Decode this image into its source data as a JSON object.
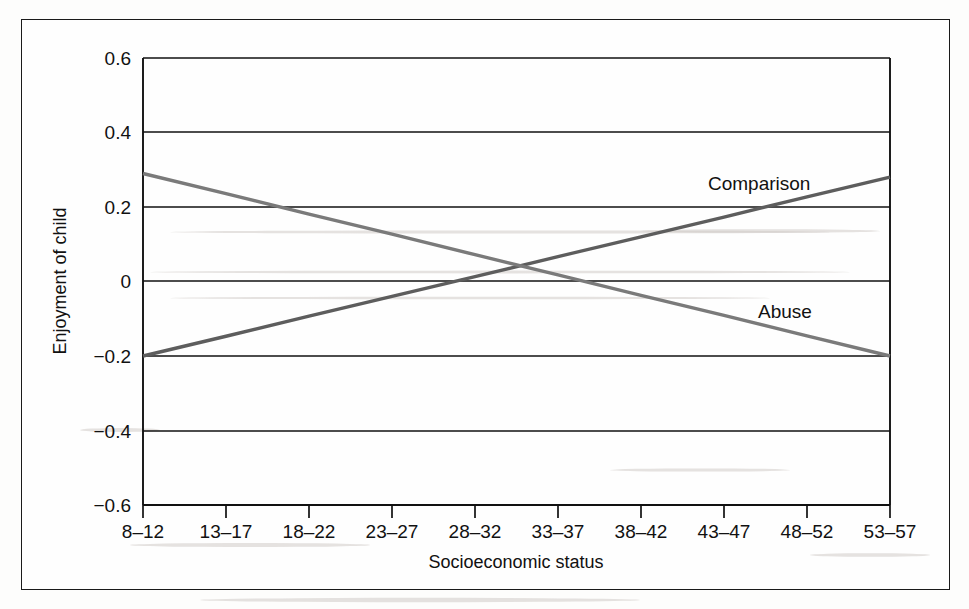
{
  "chart_data": {
    "type": "line",
    "title": "",
    "xlabel": "Socioeconomic status",
    "ylabel": "Enjoyment of child",
    "categories": [
      "8–12",
      "13–17",
      "18–22",
      "23–27",
      "28–32",
      "33–37",
      "38–42",
      "43–47",
      "48–52",
      "53–57"
    ],
    "ylim": [
      -0.6,
      0.6
    ],
    "yticks": [
      0.6,
      0.4,
      0.2,
      0,
      -0.2,
      -0.4,
      -0.6
    ],
    "ytick_labels": [
      "0.6",
      "0.4",
      "0.2",
      "0",
      "−0.2",
      "−0.4",
      "−0.6"
    ],
    "grid": true,
    "legend_position": "inline-annotations",
    "series": [
      {
        "name": "Comparison",
        "color": "#5d5d5d",
        "values": [
          -0.2,
          -0.147,
          -0.093,
          -0.04,
          0.013,
          0.067,
          0.12,
          0.173,
          0.227,
          0.28
        ],
        "label_x_category": "43–47",
        "label_value": 0.3
      },
      {
        "name": "Abuse",
        "color": "#7a7a7a",
        "values": [
          0.29,
          0.236,
          0.181,
          0.127,
          0.072,
          0.018,
          -0.037,
          -0.091,
          -0.146,
          -0.2
        ],
        "label_x_category": "43–47",
        "label_value": -0.08
      }
    ]
  },
  "axis": {
    "y_title": "Enjoyment of child",
    "x_title": "Socioeconomic status"
  },
  "series_labels": {
    "comparison": "Comparison",
    "abuse": "Abuse"
  },
  "ytick_labels": {
    "t0": "0.6",
    "t1": "0.4",
    "t2": "0.2",
    "t3": "0",
    "t4": "−0.2",
    "t5": "−0.4",
    "t6": "−0.6"
  },
  "xtick_labels": {
    "c0": "8–12",
    "c1": "13–17",
    "c2": "18–22",
    "c3": "23–27",
    "c4": "28–32",
    "c5": "33–37",
    "c6": "38–42",
    "c7": "43–47",
    "c8": "48–52",
    "c9": "53–57"
  },
  "colors": {
    "comparison_line": "#5d5d5d",
    "abuse_line": "#7a7a7a",
    "axis": "#111111",
    "frame": "#1a1a1a"
  }
}
